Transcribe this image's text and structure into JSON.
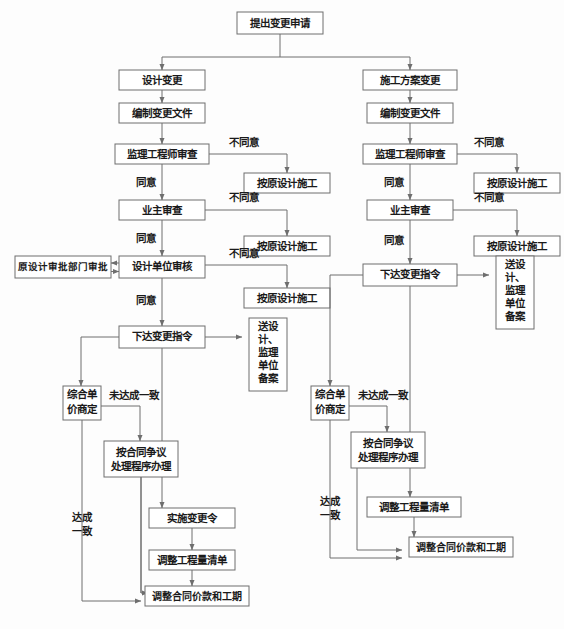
{
  "diagram": {
    "colors": {
      "line": "#6e6e6e",
      "box_fill": "#ffffff",
      "text": "#1a1a1a",
      "background": "#fdfdfd"
    },
    "start": {
      "label": "提出变更申请"
    },
    "branches": [
      {
        "id": "design",
        "name": "设计变更分支",
        "nodes": {
          "n1": "设计变更",
          "n2": "编制变更文件",
          "n3": "监理工程师审查",
          "n4": "按原设计施工",
          "n5": "业主审查",
          "n6": "按原设计施工",
          "n7": "设计单位审核",
          "n8": "原设计审批部门审批",
          "n9": "按原设计施工",
          "n10": "下达变更指令",
          "n11_lines": [
            "送设",
            "计、",
            "监理",
            "单位",
            "备案"
          ],
          "n11_full": "送设计、监理单位备案",
          "n12_lines": [
            "综合单",
            "价商定"
          ],
          "n12_full": "综合单价商定",
          "n13_lines": [
            "按合同争议",
            "处理程序办理"
          ],
          "n13_full": "按合同争议处理程序办理",
          "n14": "实施变更令",
          "n15": "调整工程量清单",
          "n16": "调整合同价款和工期"
        },
        "edge_labels": {
          "e1": "不同意",
          "e2": "同意",
          "e3": "不同意",
          "e4": "同意",
          "e5": "不同意",
          "e6": "同意",
          "e7": "未达成一致",
          "e8_lines": [
            "达成",
            "一致"
          ],
          "e8_full": "达成一致"
        }
      },
      {
        "id": "construction",
        "name": "施工方案变更分支",
        "nodes": {
          "m1": "施工方案变更",
          "m2": "编制变更文件",
          "m3": "监理工程师审查",
          "m4": "按原设计施工",
          "m5": "业主审查",
          "m6": "按原设计施工",
          "m7": "下达变更指令",
          "m8_lines": [
            "送设",
            "计、",
            "监理",
            "单位",
            "备案"
          ],
          "m8_full": "送设计、监理单位备案",
          "m9_lines": [
            "综合单",
            "价商定"
          ],
          "m9_full": "综合单价商定",
          "m10_lines": [
            "按合同争议",
            "处理程序办理"
          ],
          "m10_full": "按合同争议处理程序办理",
          "m11": "调整工程量清单",
          "m12": "调整合同价款和工期"
        },
        "edge_labels": {
          "f1": "不同意",
          "f2": "同意",
          "f3": "不同意",
          "f4": "同意",
          "f5": "未达成一致",
          "f6_lines": [
            "达成",
            "一致"
          ],
          "f6_full": "达成一致"
        }
      }
    ]
  }
}
